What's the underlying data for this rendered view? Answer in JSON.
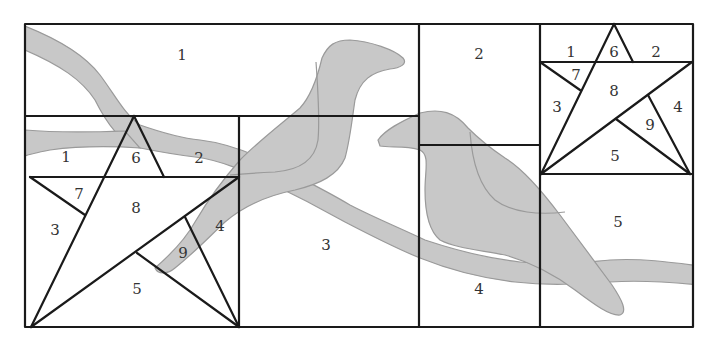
{
  "diagram": {
    "title": "",
    "colors": {
      "background": "#ffffff",
      "line": "#1a1a1a",
      "fill": "#c8c8c8",
      "fill_outline": "#9a9a9a",
      "label": "#333333"
    },
    "blocks": {
      "top_left": {
        "labels": [
          "1"
        ]
      },
      "large_star": {
        "labels": [
          "1",
          "6",
          "2",
          "7",
          "8",
          "3",
          "4",
          "9",
          "5"
        ]
      },
      "center_bottom": {
        "labels": [
          "3"
        ]
      },
      "right_column": {
        "labels": [
          "2",
          "4"
        ]
      },
      "small_star": {
        "labels": [
          "1",
          "6",
          "2",
          "7",
          "8",
          "3",
          "4",
          "9",
          "5"
        ]
      },
      "bottom_right": {
        "labels": [
          "5"
        ]
      }
    },
    "labels": {
      "tl_1": "1",
      "ls_1": "1",
      "ls_6": "6",
      "ls_2": "2",
      "ls_7": "7",
      "ls_8": "8",
      "ls_3": "3",
      "ls_4": "4",
      "ls_9": "9",
      "ls_5": "5",
      "cb_3": "3",
      "rc_2": "2",
      "rc_4": "4",
      "ss_1": "1",
      "ss_6": "6",
      "ss_2": "2",
      "ss_7": "7",
      "ss_8": "8",
      "ss_3": "3",
      "ss_4": "4",
      "ss_9": "9",
      "ss_5": "5",
      "br_5": "5"
    }
  }
}
